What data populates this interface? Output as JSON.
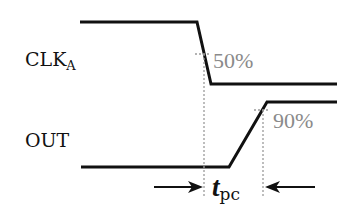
{
  "signals": [
    {
      "name": "CLK",
      "subscript": "A"
    },
    {
      "name": "OUT",
      "subscript": ""
    }
  ],
  "annotations": {
    "clk_threshold": "50%",
    "out_threshold": "90%",
    "delay_symbol": "t",
    "delay_subscript": "pc"
  },
  "colors": {
    "waveform": "#111111",
    "guide": "#9a9a9a",
    "threshold_text": "#8a8a8a"
  }
}
